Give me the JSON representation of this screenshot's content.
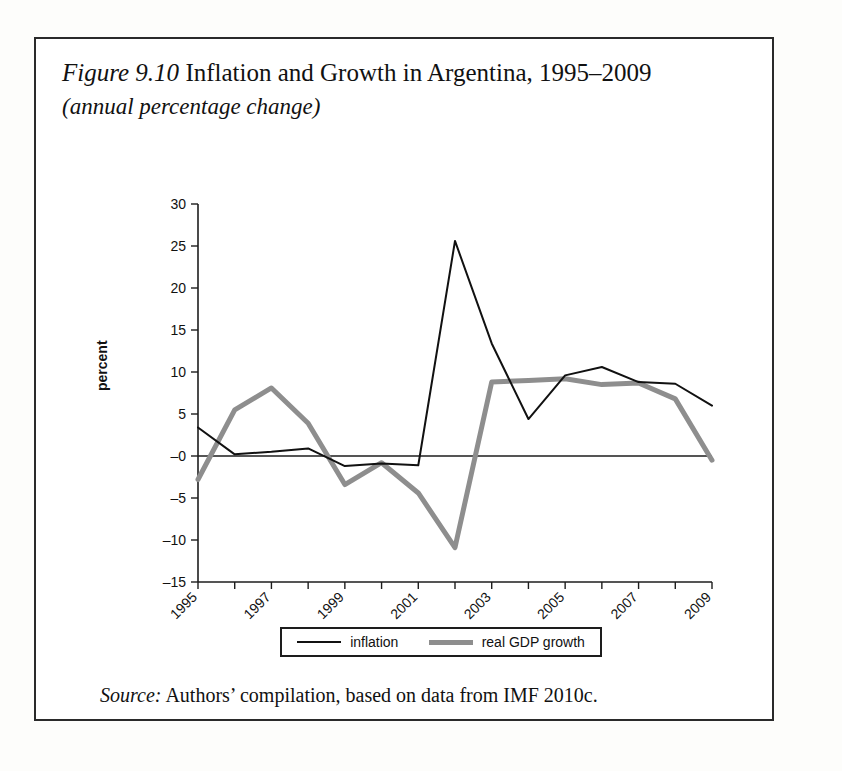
{
  "figure": {
    "label": "Figure 9.10",
    "title": "Inflation and Growth in Argentina, 1995–2009",
    "subtitle": "(annual percentage change)",
    "source_label": "Source:",
    "source_text": "Authors’ compilation, based on data from IMF 2010c."
  },
  "legend": {
    "position": "bottom",
    "items": [
      {
        "label": "inflation",
        "color": "#111111",
        "width": 2
      },
      {
        "label": "real GDP growth",
        "color": "#8e8e8e",
        "width": 5
      }
    ]
  },
  "colors": {
    "inflation": "#111111",
    "gdp": "#8e8e8e",
    "axis": "#1d1d1d",
    "frame": "#2a2a2a",
    "background": "#ffffff"
  },
  "chart_data": {
    "type": "line",
    "title": "Inflation and Growth in Argentina, 1995–2009",
    "subtitle": "(annual percentage change)",
    "xlabel": "",
    "ylabel": "percent",
    "grid": false,
    "legend_position": "bottom",
    "x": [
      1995,
      1996,
      1997,
      1998,
      1999,
      2000,
      2001,
      2002,
      2003,
      2004,
      2005,
      2006,
      2007,
      2008,
      2009
    ],
    "xtick_labels": [
      "1995",
      "1997",
      "1999",
      "2001",
      "2003",
      "2005",
      "2007",
      "2009"
    ],
    "xtick_values": [
      1995,
      1997,
      1999,
      2001,
      2003,
      2005,
      2007,
      2009
    ],
    "xlim": [
      1995,
      2009
    ],
    "ytick_labels": [
      "30",
      "25",
      "20",
      "15",
      "10",
      "5",
      "–0",
      "–5",
      "–10",
      "–15"
    ],
    "ytick_values": [
      30,
      25,
      20,
      15,
      10,
      5,
      0,
      -5,
      -10,
      -15
    ],
    "ylim": [
      -15,
      30
    ],
    "series": [
      {
        "name": "inflation",
        "color": "#111111",
        "width": 2,
        "values": [
          3.4,
          0.2,
          0.5,
          0.9,
          -1.2,
          -0.9,
          -1.1,
          25.6,
          13.4,
          4.4,
          9.6,
          10.6,
          8.8,
          8.6,
          6.0
        ]
      },
      {
        "name": "real GDP growth",
        "color": "#8e8e8e",
        "width": 5,
        "values": [
          -2.8,
          5.5,
          8.1,
          3.9,
          -3.4,
          -0.8,
          -4.4,
          -10.9,
          8.8,
          9.0,
          9.2,
          8.5,
          8.7,
          6.8,
          -0.5
        ]
      }
    ]
  }
}
